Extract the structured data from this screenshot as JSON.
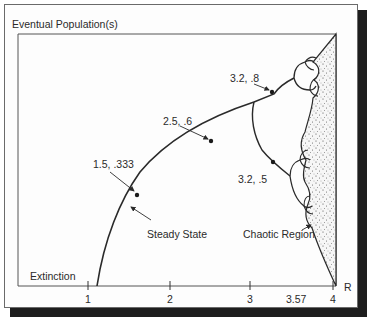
{
  "title": "Eventual Population(s)",
  "axis": {
    "x_label": "R",
    "y_label": "Eventual Population(s)",
    "ticks": [
      "1",
      "2",
      "3",
      "3.57",
      "4"
    ]
  },
  "labels": {
    "extinction": "Extinction",
    "steady_state": "Steady State",
    "chaotic_region": "Chaotic Region",
    "point_1": "1.5, .333",
    "point_2": "2.5, .6",
    "point_3": "3.2, .8",
    "point_4": "3.2, .5"
  },
  "colors": {
    "line": "#2a2a2a",
    "frame": "#6a6a6a",
    "shadow": "#1e1e1e",
    "chaos_fill": "#f4f4f4"
  }
}
